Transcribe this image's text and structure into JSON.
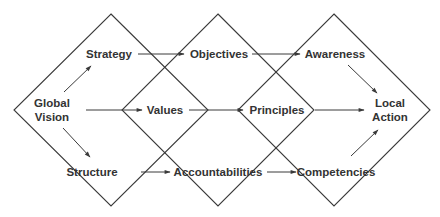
{
  "diagram": {
    "colors": {
      "line": "#3a3a3a",
      "text": "#333333",
      "background": "#ffffff"
    },
    "diamonds": [
      {
        "id": "left",
        "cx": 111,
        "cy": 110,
        "rx": 97,
        "ry": 96
      },
      {
        "id": "middle",
        "cx": 218,
        "cy": 110,
        "rx": 96,
        "ry": 96
      },
      {
        "id": "right",
        "cx": 334,
        "cy": 110,
        "rx": 96,
        "ry": 96
      }
    ],
    "nodes": {
      "global_vision": {
        "line1": "Global",
        "line2": "Vision",
        "x": 52,
        "y": 110
      },
      "strategy": {
        "label": "Strategy",
        "x": 109,
        "y": 54
      },
      "values": {
        "label": "Values",
        "x": 165,
        "y": 110
      },
      "structure": {
        "label": "Structure",
        "x": 92,
        "y": 172
      },
      "objectives": {
        "label": "Objectives",
        "x": 219,
        "y": 54
      },
      "principles": {
        "label": "Principles",
        "x": 277,
        "y": 110
      },
      "accountabilities": {
        "label": "Accountabilities",
        "x": 218,
        "y": 172
      },
      "awareness": {
        "label": "Awareness",
        "x": 335,
        "y": 54
      },
      "competencies": {
        "label": "Competencies",
        "x": 336,
        "y": 172
      },
      "local_action": {
        "line1": "Local",
        "line2": "Action",
        "x": 390,
        "y": 110
      }
    },
    "edges": [
      {
        "from": "Global Vision",
        "to": "Strategy"
      },
      {
        "from": "Global Vision",
        "to": "Values"
      },
      {
        "from": "Global Vision",
        "to": "Structure"
      },
      {
        "from": "Strategy",
        "to": "Objectives"
      },
      {
        "from": "Values",
        "to": "Principles"
      },
      {
        "from": "Structure",
        "to": "Accountabilities"
      },
      {
        "from": "Objectives",
        "to": "Awareness"
      },
      {
        "from": "Principles",
        "to": "Local Action"
      },
      {
        "from": "Accountabilities",
        "to": "Competencies"
      },
      {
        "from": "Awareness",
        "to": "Local Action"
      },
      {
        "from": "Competencies",
        "to": "Local Action"
      }
    ]
  }
}
